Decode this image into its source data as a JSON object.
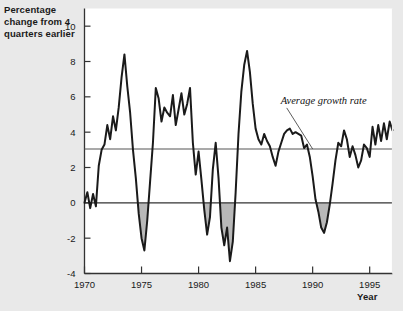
{
  "figure": {
    "background_color": "#e9e9e9",
    "plot_background_color": "#ffffff",
    "line_color": "#1a1a1a",
    "reference_line_color": "#555555",
    "shade_color": "#b8b8b8"
  },
  "labels": {
    "y_axis_title": "Percentage change from 4 quarters earlier",
    "x_axis_title": "Year",
    "annotation": "Average growth rate"
  },
  "chart_data": {
    "type": "line",
    "title": "",
    "xlabel": "Year",
    "ylabel": "Percentage change from 4 quarters earlier",
    "xlim": [
      1970,
      1997
    ],
    "ylim": [
      -4,
      11
    ],
    "xticks": [
      1970,
      1975,
      1980,
      1985,
      1990,
      1995
    ],
    "xtick_labels": [
      "1970",
      "1975",
      "1980",
      "1985",
      "1990",
      "1995"
    ],
    "yticks": [
      -4,
      -2,
      0,
      2,
      4,
      6,
      8,
      10
    ],
    "ytick_labels": [
      "-4",
      "-2",
      "0",
      "2",
      "4",
      "6",
      "8",
      "10"
    ],
    "grid": false,
    "legend": "none",
    "annotations": [
      {
        "text": "Average growth rate",
        "x": 1987.2,
        "y": 5.6,
        "leader_to_x": 1990.0,
        "leader_to_y": 3.05
      }
    ],
    "reference_lines": [
      {
        "name": "average-growth-rate",
        "y": 3.05,
        "color": "#555555"
      },
      {
        "name": "zero-line",
        "y": 0,
        "color": "#333333"
      }
    ],
    "shaded_below_zero": true,
    "series": [
      {
        "name": "Real GDP growth, percentage change from 4 quarters earlier",
        "x": [
          1970.0,
          1970.25,
          1970.5,
          1970.75,
          1971.0,
          1971.25,
          1971.5,
          1971.75,
          1972.0,
          1972.25,
          1972.5,
          1972.75,
          1973.0,
          1973.25,
          1973.5,
          1973.75,
          1974.0,
          1974.25,
          1974.5,
          1974.75,
          1975.0,
          1975.25,
          1975.5,
          1975.75,
          1976.0,
          1976.25,
          1976.5,
          1976.75,
          1977.0,
          1977.25,
          1977.5,
          1977.75,
          1978.0,
          1978.25,
          1978.5,
          1978.75,
          1979.0,
          1979.25,
          1979.5,
          1979.75,
          1980.0,
          1980.25,
          1980.5,
          1980.75,
          1981.0,
          1981.25,
          1981.5,
          1981.75,
          1982.0,
          1982.25,
          1982.5,
          1982.75,
          1983.0,
          1983.25,
          1983.5,
          1983.75,
          1984.0,
          1984.25,
          1984.5,
          1984.75,
          1985.0,
          1985.25,
          1985.5,
          1985.75,
          1986.0,
          1986.25,
          1986.5,
          1986.75,
          1987.0,
          1987.25,
          1987.5,
          1987.75,
          1988.0,
          1988.25,
          1988.5,
          1988.75,
          1989.0,
          1989.25,
          1989.5,
          1989.75,
          1990.0,
          1990.25,
          1990.5,
          1990.75,
          1991.0,
          1991.25,
          1991.5,
          1991.75,
          1992.0,
          1992.25,
          1992.5,
          1992.75,
          1993.0,
          1993.25,
          1993.5,
          1993.75,
          1994.0,
          1994.25,
          1994.5,
          1994.75,
          1995.0,
          1995.25,
          1995.5,
          1995.75,
          1996.0,
          1996.25,
          1996.5,
          1996.75,
          1997.0
        ],
        "y": [
          0.0,
          0.6,
          -0.3,
          0.5,
          -0.2,
          2.1,
          3.0,
          3.3,
          4.4,
          3.6,
          4.9,
          4.1,
          5.4,
          7.1,
          8.4,
          6.6,
          5.1,
          3.0,
          1.4,
          -0.6,
          -2.0,
          -2.7,
          -1.0,
          1.2,
          3.4,
          6.5,
          5.9,
          4.6,
          5.4,
          5.1,
          4.9,
          6.1,
          4.4,
          5.3,
          6.2,
          5.0,
          5.6,
          6.5,
          3.4,
          1.6,
          2.9,
          1.3,
          -0.4,
          -1.8,
          -0.8,
          1.9,
          3.4,
          1.4,
          -1.4,
          -2.4,
          -1.4,
          -3.3,
          -2.2,
          0.6,
          3.9,
          6.3,
          7.8,
          8.6,
          7.4,
          5.6,
          4.2,
          3.6,
          3.3,
          3.9,
          3.5,
          3.2,
          2.6,
          2.1,
          2.9,
          3.4,
          3.9,
          4.1,
          4.2,
          3.9,
          4.0,
          3.9,
          3.8,
          3.1,
          3.3,
          2.6,
          1.5,
          0.2,
          -0.5,
          -1.4,
          -1.7,
          -1.1,
          -0.1,
          1.1,
          2.4,
          3.4,
          3.2,
          4.1,
          3.6,
          2.6,
          3.2,
          2.7,
          2.0,
          2.4,
          3.3,
          3.1,
          2.6,
          4.3,
          3.3,
          4.4,
          3.5,
          4.5,
          3.6,
          4.6,
          4.1
        ]
      }
    ]
  }
}
